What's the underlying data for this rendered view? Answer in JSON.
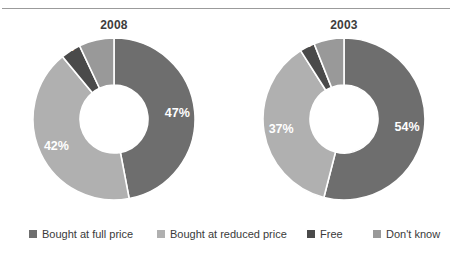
{
  "figure": {
    "background": "#ffffff",
    "rule_color": "#9b9b9b"
  },
  "chart_data": {
    "type": "pie",
    "variant": "donut",
    "title": "",
    "subtitle": "",
    "xlabel": "",
    "ylabel": "",
    "grid": false,
    "legend_position": "bottom",
    "value_suffix": "%",
    "categories": [
      "Bought at full price",
      "Bought at reduced price",
      "Free",
      "Don't know"
    ],
    "colors": [
      "#6e6e6e",
      "#b0b0b0",
      "#4a4a4a",
      "#999999"
    ],
    "series": [
      {
        "name": "2008",
        "values": [
          47,
          42,
          4,
          7
        ],
        "labels": [
          "47%",
          "42%",
          "4%",
          "7%"
        ]
      },
      {
        "name": "2003",
        "values": [
          54,
          37,
          3,
          6
        ],
        "labels": [
          "54%",
          "37%",
          "3%",
          "6%"
        ]
      }
    ]
  },
  "charts": [
    {
      "title": "2008",
      "slices": [
        {
          "label": "47%",
          "value": 47,
          "category": "Bought at full price",
          "color": "#6e6e6e"
        },
        {
          "label": "42%",
          "value": 42,
          "category": "Bought at reduced price",
          "color": "#b0b0b0"
        },
        {
          "label": "4%",
          "value": 4,
          "category": "Free",
          "color": "#4a4a4a"
        },
        {
          "label": "7%",
          "value": 7,
          "category": "Don't know",
          "color": "#999999"
        }
      ]
    },
    {
      "title": "2003",
      "slices": [
        {
          "label": "54%",
          "value": 54,
          "category": "Bought at full price",
          "color": "#6e6e6e"
        },
        {
          "label": "37%",
          "value": 37,
          "category": "Bought at reduced price",
          "color": "#b0b0b0"
        },
        {
          "label": "3%",
          "value": 3,
          "category": "Free",
          "color": "#4a4a4a"
        },
        {
          "label": "6%",
          "value": 6,
          "category": "Don't know",
          "color": "#999999"
        }
      ]
    }
  ],
  "legend": {
    "items": [
      {
        "label": "Bought at full price",
        "color": "#6e6e6e"
      },
      {
        "label": "Bought at reduced price",
        "color": "#b0b0b0"
      },
      {
        "label": "Free",
        "color": "#4a4a4a"
      },
      {
        "label": "Don't know",
        "color": "#999999"
      }
    ]
  }
}
